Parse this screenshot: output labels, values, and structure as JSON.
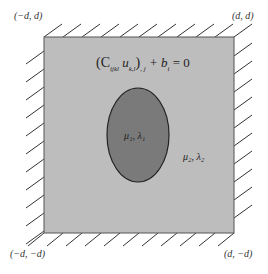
{
  "diagram": {
    "corners": {
      "top_left": "(−d, d)",
      "top_right": "(d, d)",
      "bottom_left": "(−d, −d)",
      "bottom_right": "(d, −d)"
    },
    "equation": "(C",
    "equation_sub1": "ijkl",
    "equation_mid": " u",
    "equation_sub2": "k,l",
    "equation_mid2": ")",
    "equation_sub3": ", j",
    "equation_tail": " + b",
    "equation_sub4": "i",
    "equation_end": " = 0",
    "inclusion_label": "μ₁, λ₁",
    "matrix_label": "μ₂, λ₂",
    "colors": {
      "matrix_fill": "#bdbdbd",
      "inclusion_fill": "#7a7a7a",
      "border": "#555555",
      "hatch": "#333333"
    }
  }
}
